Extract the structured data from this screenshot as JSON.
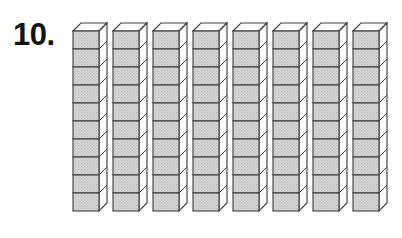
{
  "worksheet": {
    "problem_number_label": "10.",
    "background_color": "#ffffff",
    "ink_color": "#141414"
  },
  "manipulative": {
    "type": "base-ten-blocks",
    "rod_count": 8,
    "cubes_per_rod": 10,
    "total_units": 80,
    "rod_names": [
      "ten-rod-1",
      "ten-rod-2",
      "ten-rod-3",
      "ten-rod-4",
      "ten-rod-5",
      "ten-rod-6",
      "ten-rod-7",
      "ten-rod-8"
    ],
    "colors": {
      "front_face": "#d2d2d2",
      "top_face": "#fdfdfd",
      "side_face": "#fbfbfb",
      "outline": "#3a3a3a"
    },
    "geometry": {
      "rod_left_start_px": 72,
      "rod_pitch_px": 40,
      "rod_top_px": 22,
      "cube_width_px": 26,
      "cube_height_px": 18,
      "depth_offset_x_px": 8,
      "depth_offset_y_px": 8
    }
  },
  "icons": {
    "cube_icon_name": "unit-cube-icon",
    "rod_icon_name": "ten-rod-icon"
  }
}
